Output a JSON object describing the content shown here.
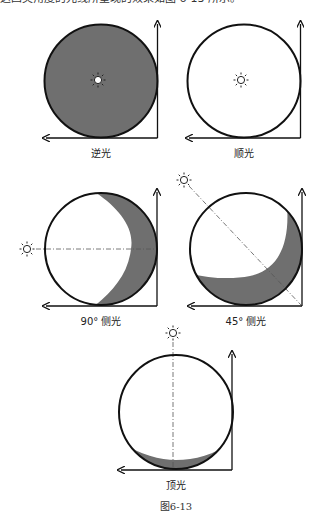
{
  "header_fragment": "这四类角度的光线所呈现的效果如图 6-13 所示。",
  "colors": {
    "shadow": "#6f6f6f",
    "outline": "#111111",
    "guide": "#555555"
  },
  "diagrams": [
    {
      "id": "back-light",
      "label": "逆光",
      "light_direction": "behind subject (center)",
      "shadow": "full"
    },
    {
      "id": "front-light",
      "label": "顺光",
      "light_direction": "front (center)",
      "shadow": "none"
    },
    {
      "id": "side-light-90",
      "label": "90° 侧光",
      "light_direction": "left, 90°",
      "shadow": "right crescent"
    },
    {
      "id": "side-light-45",
      "label": "45° 侧光",
      "light_direction": "upper-left, 45°",
      "shadow": "lower-right crescent"
    },
    {
      "id": "top-light",
      "label": "顶光",
      "light_direction": "top",
      "shadow": "bottom crescent"
    }
  ],
  "caption": "图6-13",
  "icons": {
    "light_source": "sun-icon",
    "axis_arrow": "arrow-icon"
  }
}
